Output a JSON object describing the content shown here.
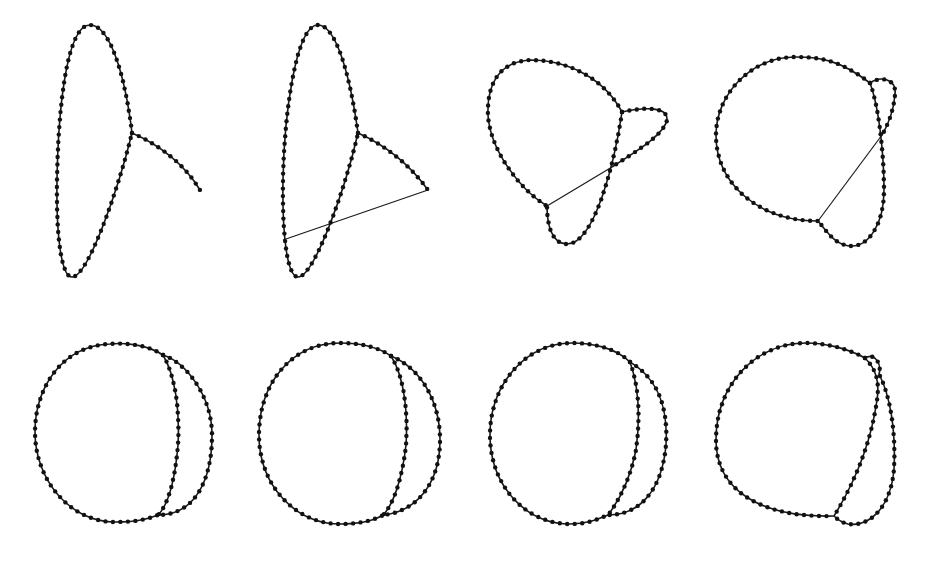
{
  "figure": {
    "colors": {
      "background": "#ffffff",
      "edge": "#1a1a1a",
      "node": "#111111"
    },
    "node_radius": 2.2,
    "panels": [
      {
        "id": "panel-1",
        "paths": [
          "M132,133 C125,75 110,25 90,25 C65,25 58,120 57,180 C56,240 62,277 72,277 C88,277 118,190 132,133",
          "M132,133 C160,145 185,165 200,190"
        ],
        "lines": []
      },
      {
        "id": "panel-2",
        "paths": [
          "M358,133 C350,75 336,25 318,25 C295,25 284,120 283,180 C282,240 288,277 298,277 C314,277 345,190 358,133",
          "M358,133 C385,145 410,165 428,190"
        ],
        "lines": [
          [
            428,
            190,
            283,
            240
          ]
        ]
      },
      {
        "id": "panel-3",
        "paths": [
          "M622,112 C605,80 570,60 530,60 C495,62 487,90 488,115 C490,150 520,190 547,206",
          "M622,112 C640,108 668,105 667,120 C664,135 635,152 612,167",
          "M622,112 C615,160 595,244 567,244 C552,244 547,225 547,206"
        ],
        "lines": [
          [
            547,
            206,
            612,
            167
          ]
        ]
      },
      {
        "id": "panel-4",
        "paths": [
          "M870,83 C840,60 820,57 796,57 C750,57 716,95 716,135 C716,185 760,221 818,221",
          "M870,83 C880,76 897,78 895,95 C893,115 885,130 882,135",
          "M870,83 C880,110 884,160 884,190 C884,225 868,246 852,246 C835,246 826,230 818,221"
        ],
        "lines": [
          [
            818,
            221,
            882,
            135
          ]
        ]
      },
      {
        "id": "panel-5",
        "paths": [
          "M163,355 C145,343 120,343 110,344 C60,346 35,390 35,432 C35,480 70,522 115,522 C140,522 150,518 158,515",
          "M163,355 C185,362 212,395 212,435 C212,480 195,515 158,515",
          "M163,355 C175,375 180,410 178,445 C175,480 168,505 158,515"
        ],
        "lines": []
      },
      {
        "id": "panel-6",
        "paths": [
          "M391,356 C375,345 355,343 340,343 C290,343 259,385 259,435 C259,485 295,524 340,524 C360,524 375,520 383,515",
          "M391,356 C420,368 440,400 440,440 C440,485 415,512 383,515",
          "M391,356 C405,378 408,415 406,445 C402,480 393,505 383,515"
        ],
        "lines": []
      },
      {
        "id": "panel-7",
        "paths": [
          "M630,362 C615,347 590,343 572,343 C525,343 490,385 490,435 C490,485 525,524 570,524 C590,524 600,518 608,515",
          "M630,362 C660,380 668,410 666,445 C662,490 640,515 608,515",
          "M630,362 C640,390 640,420 636,450 C630,480 618,502 608,515"
        ],
        "lines": []
      },
      {
        "id": "panel-8",
        "paths": [
          "M865,358 C845,347 822,343 806,343 C755,343 716,385 716,440 C716,490 760,518 834,516",
          "M865,358 C875,352 882,365 879,374 C890,395 896,430 894,470 C890,510 868,527 848,524 C840,522 836,518 834,516",
          "M865,358 C875,368 880,380 877,400 C870,450 850,490 834,516"
        ],
        "lines": []
      }
    ]
  }
}
